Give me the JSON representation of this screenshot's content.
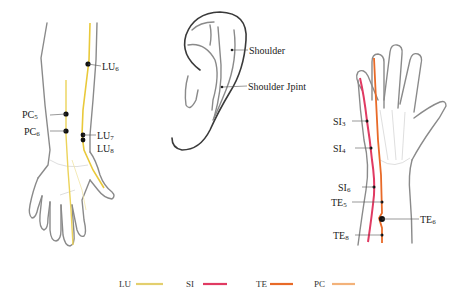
{
  "figure": {
    "panels": [
      {
        "id": "left-forearm",
        "points": [
          {
            "name": "LU",
            "sub": "6",
            "x": 88,
            "y": 64
          },
          {
            "name": "PC",
            "sub": "5",
            "x": 66,
            "y": 114
          },
          {
            "name": "PC",
            "sub": "6",
            "x": 66,
            "y": 131
          },
          {
            "name": "LU",
            "sub": "7",
            "x": 83,
            "y": 135
          },
          {
            "name": "LU",
            "sub": "8",
            "x": 83,
            "y": 140
          }
        ]
      },
      {
        "id": "ear",
        "points": [
          {
            "label": "Shoulder",
            "x": 232,
            "y": 50
          },
          {
            "label": "Shoulder Jpint",
            "x": 222,
            "y": 87
          }
        ]
      },
      {
        "id": "right-hand",
        "points": [
          {
            "name": "SI",
            "sub": "3",
            "x": 367,
            "y": 121
          },
          {
            "name": "SI",
            "sub": "4",
            "x": 371,
            "y": 148
          },
          {
            "name": "SI",
            "sub": "6",
            "x": 374,
            "y": 187
          },
          {
            "name": "TE",
            "sub": "5",
            "x": 382,
            "y": 202
          },
          {
            "name": "TE",
            "sub": "6",
            "x": 382,
            "y": 219
          },
          {
            "name": "TE",
            "sub": "8",
            "x": 382,
            "y": 235
          }
        ]
      }
    ],
    "labels": {
      "LU6": {
        "main": "LU",
        "sub": "6"
      },
      "PC5": {
        "main": "PC",
        "sub": "5"
      },
      "PC6": {
        "main": "PC",
        "sub": "6"
      },
      "LU7": {
        "main": "LU",
        "sub": "7"
      },
      "LU8": {
        "main": "LU",
        "sub": "8"
      },
      "shoulder": "Shoulder",
      "shoulder_joint": "Shoulder Jpint",
      "SI3": {
        "main": "SI",
        "sub": "3"
      },
      "SI4": {
        "main": "SI",
        "sub": "4"
      },
      "SI6": {
        "main": "SI",
        "sub": "6"
      },
      "TE5": {
        "main": "TE",
        "sub": "5"
      },
      "TE6": {
        "main": "TE",
        "sub": "6"
      },
      "TE8": {
        "main": "TE",
        "sub": "8"
      }
    },
    "legend": [
      {
        "label": "LU",
        "color": "#e3cf6e"
      },
      {
        "label": "SI",
        "color": "#e03a62"
      },
      {
        "label": "TE",
        "color": "#e86a28"
      },
      {
        "label": "PC",
        "color": "#f3b27a"
      }
    ],
    "colors": {
      "LU": "#e3cf6e",
      "LU_line": "#e9c93a",
      "SI": "#e03a62",
      "TE": "#e86a28",
      "PC": "#f3b27a",
      "outline": "#8a8a8a",
      "ear_outline": "#3a3a3a"
    }
  }
}
